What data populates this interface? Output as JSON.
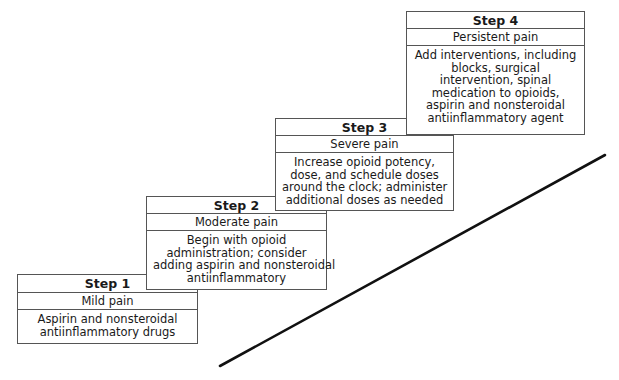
{
  "diagram": {
    "type": "staircase",
    "steps": [
      {
        "title": "Step 1",
        "level": "Mild pain",
        "description_lines": [
          "Aspirin and nonsteroidal",
          "antiinflammatory drugs"
        ]
      },
      {
        "title": "Step 2",
        "level": "Moderate pain",
        "description_lines": [
          "Begin with opioid",
          "administration; consider",
          "adding aspirin and nonsteroidal",
          "antiinflammatory"
        ]
      },
      {
        "title": "Step 3",
        "level": "Severe pain",
        "description_lines": [
          "Increase opioid potency,",
          "dose, and schedule doses",
          "around the clock; administer",
          "additional doses as needed"
        ]
      },
      {
        "title": "Step 4",
        "level": "Persistent pain",
        "description_lines": [
          "Add interventions, including",
          "blocks, surgical",
          "intervention, spinal",
          "medication to opioids,",
          "aspirin and nonsteroidal",
          "antiinflammatory agent"
        ]
      }
    ],
    "colors": {
      "border": "#555555",
      "text": "#1a1a1a",
      "line": "#111111",
      "background": "#ffffff"
    }
  }
}
